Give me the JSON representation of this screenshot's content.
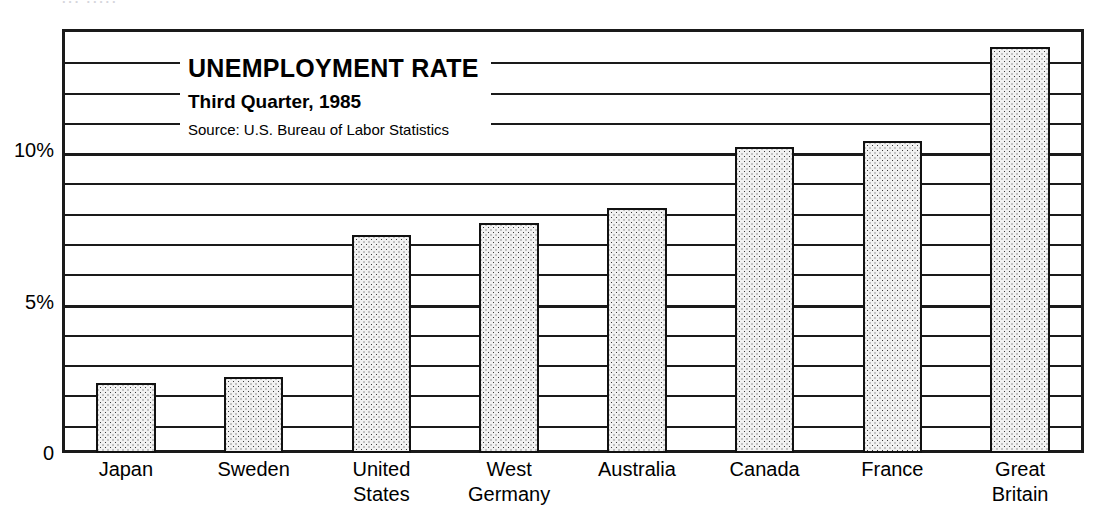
{
  "scan_remnant": "···  ·····",
  "titles": {
    "main": "UNEMPLOYMENT RATE",
    "sub": "Third Quarter, 1985",
    "source": "Source: U.S. Bureau of Labor Statistics"
  },
  "axis": {
    "y_ticks": [
      {
        "label": "10%",
        "value": 10
      },
      {
        "label": "5%",
        "value": 5
      },
      {
        "label": "0",
        "value": 0
      }
    ]
  },
  "colors": {
    "ink": "#1a1a1a",
    "bar_fill": "#f2f2f2",
    "bar_dots": "#3a3a3a",
    "page": "#ffffff"
  },
  "chart_data": {
    "type": "bar",
    "title": "UNEMPLOYMENT RATE",
    "subtitle": "Third Quarter, 1985",
    "annotations": [
      "Source: U.S. Bureau of Labor Statistics"
    ],
    "xlabel": "",
    "ylabel": "",
    "ylim": [
      0,
      14
    ],
    "grid": true,
    "grid_interval": 1,
    "legend": "none",
    "categories": [
      "Japan",
      "Sweden",
      "United States",
      "West Germany",
      "Australia",
      "Canada",
      "France",
      "Great Britain"
    ],
    "values": [
      2.3,
      2.5,
      7.2,
      7.6,
      8.1,
      10.1,
      10.3,
      13.4
    ],
    "value_unit": "percent"
  }
}
